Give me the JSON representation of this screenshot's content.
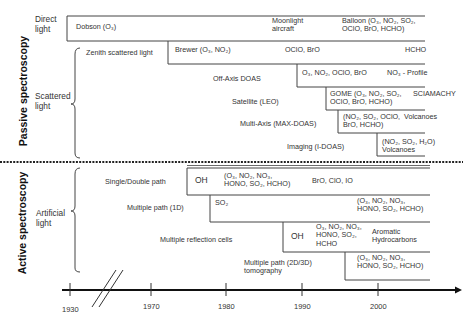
{
  "sections": {
    "passive": "Passive spectroscopy",
    "active": "Active spectroscopy"
  },
  "categories": {
    "direct": [
      "Direct",
      "light"
    ],
    "scattered": [
      "Scattered",
      "light"
    ],
    "artificial": [
      "Artificial",
      "light"
    ]
  },
  "passive_rows": {
    "dobson": "Dobson (O₃)",
    "moonlight": [
      "Moonlight",
      "aircraft"
    ],
    "balloon": [
      "Balloon (O₃, NO₂, SO₂,",
      "OClO, BrO, HCHO)"
    ],
    "zenith": "Zenith scattered light",
    "brewer": "Brewer (O₃, NO₂)",
    "zenith_species": "OClO, BrO",
    "zenith_hcho": "HCHO",
    "offaxis": "Off-Axis DOAS",
    "offaxis_species": "O₃, NO₂, OClO, BrO",
    "offaxis_profile": "NO₃ - Profile",
    "satellite": "Satellite (LEO)",
    "gome": [
      "GOME (O₃, NO₂, SO₂,",
      "OClO, BrO, HCHO)"
    ],
    "sciamachy": "SCIAMACHY",
    "maxdoas": "Multi-Axis (MAX-DOAS)",
    "maxdoas_species": [
      "(NO₂, SO₂, OClO,",
      "BrO, HCHO)"
    ],
    "maxdoas_volcanoes": "Volcanoes",
    "imaging": "Imaging (I-DOAS)",
    "imaging_species": [
      "(NO₂, SO₂, H₂O)",
      "Volcanoes"
    ]
  },
  "active_rows": {
    "single": "Single/Double path",
    "single_oh": "OH",
    "single_species": [
      "(O₃, NO₂, NO₃,",
      "HONO, SO₂, HCHO)"
    ],
    "single_halogens": "BrO, ClO, IO",
    "multi1d": "Multiple path (1D)",
    "multi1d_so2": "SO₂",
    "multi1d_species": [
      "(O₃, NO₂, NO₃,",
      "HONO, SO₂, HCHO)"
    ],
    "cells": "Multiple reflection cells",
    "cells_oh": "OH",
    "cells_species": [
      "O₃, NO₂, NO₃,",
      "HONO, SO₂,",
      "HCHO"
    ],
    "cells_aromatic": [
      "Aromatic",
      "Hydrocarbons"
    ],
    "tomo": [
      "Multiple path  (2D/3D)",
      "tomography"
    ],
    "tomo_species": [
      "(O₃, NO₂, NO₃,",
      "HONO, SO₂, HCHO)"
    ]
  },
  "axis": {
    "ticks": [
      "1930",
      "1970",
      "1980",
      "1990",
      "2000"
    ]
  }
}
